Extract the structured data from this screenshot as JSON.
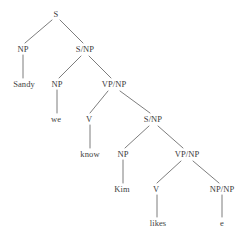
{
  "figure": {
    "type": "syntax-tree",
    "title": "",
    "sentence": "Sandy we know Kim likes e",
    "colors": {
      "background": "#ffffff",
      "text": "#3b3b3b",
      "edge": "#6e6e6e"
    }
  },
  "nodes": [
    {
      "id": "n0",
      "label": "S",
      "kind": "nonterminal",
      "x": 56,
      "y": 14
    },
    {
      "id": "n1",
      "label": "NP",
      "kind": "nonterminal",
      "x": 23,
      "y": 49
    },
    {
      "id": "n2",
      "label": "S/NP",
      "kind": "nonterminal",
      "x": 85,
      "y": 49
    },
    {
      "id": "n3",
      "label": "Sandy",
      "kind": "terminal",
      "x": 24,
      "y": 84
    },
    {
      "id": "n4",
      "label": "NP",
      "kind": "nonterminal",
      "x": 57,
      "y": 84
    },
    {
      "id": "n5",
      "label": "VP/NP",
      "kind": "nonterminal",
      "x": 114,
      "y": 84
    },
    {
      "id": "n6",
      "label": "we",
      "kind": "terminal",
      "x": 56,
      "y": 119
    },
    {
      "id": "n7",
      "label": "V",
      "kind": "nonterminal",
      "x": 89,
      "y": 119
    },
    {
      "id": "n8",
      "label": "S/NP",
      "kind": "nonterminal",
      "x": 153,
      "y": 119
    },
    {
      "id": "n9",
      "label": "know",
      "kind": "terminal",
      "x": 90,
      "y": 154
    },
    {
      "id": "n10",
      "label": "NP",
      "kind": "nonterminal",
      "x": 123,
      "y": 154
    },
    {
      "id": "n11",
      "label": "VP/NP",
      "kind": "nonterminal",
      "x": 187,
      "y": 154
    },
    {
      "id": "n12",
      "label": "Kim",
      "kind": "terminal",
      "x": 122,
      "y": 189
    },
    {
      "id": "n13",
      "label": "V",
      "kind": "nonterminal",
      "x": 156,
      "y": 189
    },
    {
      "id": "n14",
      "label": "NP/NP",
      "kind": "nonterminal",
      "x": 222,
      "y": 189
    },
    {
      "id": "n15",
      "label": "likes",
      "kind": "terminal",
      "x": 158,
      "y": 223
    },
    {
      "id": "n16",
      "label": "e",
      "kind": "terminal",
      "x": 222,
      "y": 223
    }
  ],
  "edges": [
    {
      "from": "n0",
      "to": "n1",
      "x1": 52,
      "y1": 20,
      "x2": 25,
      "y2": 43
    },
    {
      "from": "n0",
      "to": "n2",
      "x1": 60,
      "y1": 20,
      "x2": 83,
      "y2": 43
    },
    {
      "from": "n1",
      "to": "n3",
      "x1": 23,
      "y1": 55,
      "x2": 23,
      "y2": 78
    },
    {
      "from": "n2",
      "to": "n4",
      "x1": 81,
      "y1": 56,
      "x2": 59,
      "y2": 78
    },
    {
      "from": "n2",
      "to": "n5",
      "x1": 89,
      "y1": 56,
      "x2": 111,
      "y2": 78
    },
    {
      "from": "n4",
      "to": "n6",
      "x1": 57,
      "y1": 90,
      "x2": 57,
      "y2": 113
    },
    {
      "from": "n5",
      "to": "n7",
      "x1": 108,
      "y1": 91,
      "x2": 90,
      "y2": 113
    },
    {
      "from": "n5",
      "to": "n8",
      "x1": 120,
      "y1": 91,
      "x2": 150,
      "y2": 113
    },
    {
      "from": "n7",
      "to": "n9",
      "x1": 90,
      "y1": 125,
      "x2": 90,
      "y2": 148
    },
    {
      "from": "n8",
      "to": "n10",
      "x1": 149,
      "y1": 126,
      "x2": 125,
      "y2": 148
    },
    {
      "from": "n8",
      "to": "n11",
      "x1": 158,
      "y1": 126,
      "x2": 183,
      "y2": 148
    },
    {
      "from": "n10",
      "to": "n12",
      "x1": 123,
      "y1": 160,
      "x2": 123,
      "y2": 183
    },
    {
      "from": "n11",
      "to": "n13",
      "x1": 181,
      "y1": 161,
      "x2": 157,
      "y2": 183
    },
    {
      "from": "n11",
      "to": "n14",
      "x1": 193,
      "y1": 161,
      "x2": 219,
      "y2": 183
    },
    {
      "from": "n13",
      "to": "n15",
      "x1": 157,
      "y1": 195,
      "x2": 157,
      "y2": 217
    },
    {
      "from": "n14",
      "to": "n16",
      "x1": 222,
      "y1": 195,
      "x2": 222,
      "y2": 217
    }
  ]
}
